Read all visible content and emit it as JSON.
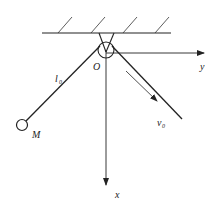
{
  "diagram": {
    "labels": {
      "origin": "O",
      "y_axis": "y",
      "x_axis": "x",
      "mass": "M",
      "length": "l",
      "length_sub": "0",
      "velocity": "v",
      "velocity_sub": "0"
    },
    "colors": {
      "stroke": "#222222",
      "background": "#ffffff"
    }
  }
}
